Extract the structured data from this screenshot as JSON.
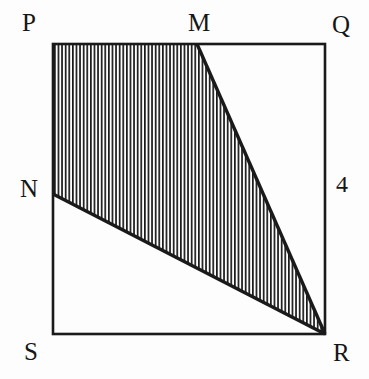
{
  "figure": {
    "background_color": "#fdfdfd",
    "stroke_color": "#1a1a1a",
    "hatch_color": "#1a1a1a",
    "square": {
      "name": "PQRS",
      "side_length_label": "4",
      "corners": {
        "P": {
          "label": "P",
          "x": 53,
          "y": 44
        },
        "Q": {
          "label": "Q",
          "x": 325,
          "y": 44
        },
        "R": {
          "label": "R",
          "x": 325,
          "y": 334
        },
        "S": {
          "label": "S",
          "x": 53,
          "y": 334
        }
      }
    },
    "points": {
      "M": {
        "label": "M",
        "x": 197,
        "y": 44,
        "on_edge": "PQ"
      },
      "N": {
        "label": "N",
        "x": 53,
        "y": 194,
        "on_edge": "PS"
      }
    },
    "segments": [
      {
        "name": "PQ",
        "from": "P",
        "to": "Q"
      },
      {
        "name": "QR",
        "from": "Q",
        "to": "R"
      },
      {
        "name": "RS",
        "from": "R",
        "to": "S"
      },
      {
        "name": "SP",
        "from": "S",
        "to": "P"
      },
      {
        "name": "MR",
        "from": "M",
        "to": "R"
      },
      {
        "name": "NR",
        "from": "N",
        "to": "R"
      }
    ],
    "shaded_region": {
      "name": "PMRN",
      "vertices": [
        "P",
        "M",
        "R",
        "N"
      ],
      "fill_style": "vertical-hatch",
      "hatch_spacing_px": 3.6,
      "hatch_line_width_px": 1.6
    },
    "labels": {
      "P": "P",
      "Q": "Q",
      "M": "M",
      "N": "N",
      "S": "S",
      "R": "R",
      "side_measure": "4"
    }
  }
}
